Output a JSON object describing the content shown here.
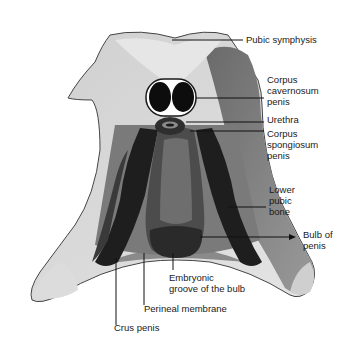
{
  "figure": {
    "colors": {
      "bone": "#d4d4d4",
      "muscle_dark": "#1e1e1e",
      "muscle_mid": "#555555",
      "membrane": "#8a8a8a",
      "label": "#1a1a1a"
    }
  },
  "labels": {
    "pubic_symphysis": "Pubic symphysis",
    "corpus_cavernosum": "Corpus\ncavernosum\npenis",
    "urethra": "Urethra",
    "corpus_spongiosum": "Corpus\nspongiosum\npenis",
    "lower_pubic_bone": "Lower\npubic\nbone",
    "bulb_of_penis": "Bulb of\npenis",
    "embryonic_groove": "Embryonic\ngroove of the bulb",
    "perineal_membrane": "Perineal membrane",
    "crus_penis": "Crus penis"
  }
}
